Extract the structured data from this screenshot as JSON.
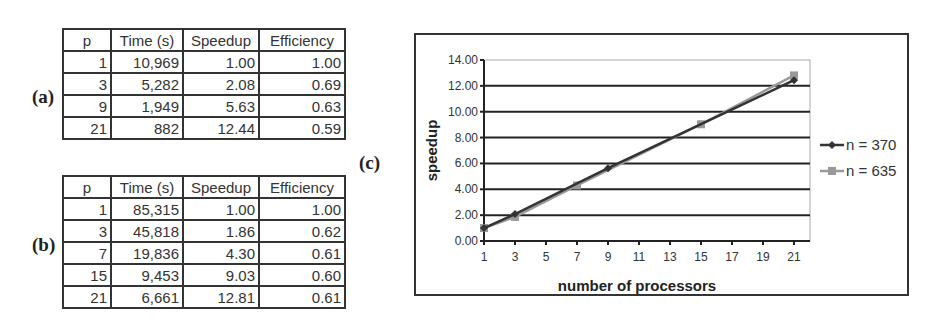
{
  "labels": {
    "a": "(a)",
    "b": "(b)",
    "c": "(c)"
  },
  "table_a": {
    "headers": [
      "p",
      "Time (s)",
      "Speedup",
      "Efficiency"
    ],
    "rows": [
      [
        "1",
        "10,969",
        "1.00",
        "1.00"
      ],
      [
        "3",
        "5,282",
        "2.08",
        "0.69"
      ],
      [
        "9",
        "1,949",
        "5.63",
        "0.63"
      ],
      [
        "21",
        "882",
        "12.44",
        "0.59"
      ]
    ]
  },
  "table_b": {
    "headers": [
      "p",
      "Time (s)",
      "Speedup",
      "Efficiency"
    ],
    "rows": [
      [
        "1",
        "85,315",
        "1.00",
        "1.00"
      ],
      [
        "3",
        "45,818",
        "1.86",
        "0.62"
      ],
      [
        "7",
        "19,836",
        "4.30",
        "0.61"
      ],
      [
        "15",
        "9,453",
        "9.03",
        "0.60"
      ],
      [
        "21",
        "6,661",
        "12.81",
        "0.61"
      ]
    ]
  },
  "chart_data": {
    "type": "line",
    "title": "",
    "xlabel": "number of processors",
    "ylabel": "speedup",
    "x_ticks": [
      "1",
      "3",
      "5",
      "7",
      "9",
      "11",
      "13",
      "15",
      "17",
      "19",
      "21"
    ],
    "y_ticks": [
      "0.00",
      "2.00",
      "4.00",
      "6.00",
      "8.00",
      "10.00",
      "12.00",
      "14.00"
    ],
    "xlim": [
      1,
      22
    ],
    "ylim": [
      0,
      14
    ],
    "grid": true,
    "legend_position": "right",
    "series": [
      {
        "name": "n = 370",
        "color": "#333333",
        "marker": "diamond",
        "x": [
          1,
          3,
          9,
          21
        ],
        "values": [
          1.0,
          2.08,
          5.63,
          12.44
        ]
      },
      {
        "name": "n = 635",
        "color": "#999999",
        "marker": "square",
        "x": [
          1,
          3,
          7,
          15,
          21
        ],
        "values": [
          1.0,
          1.86,
          4.3,
          9.03,
          12.81
        ]
      }
    ]
  }
}
